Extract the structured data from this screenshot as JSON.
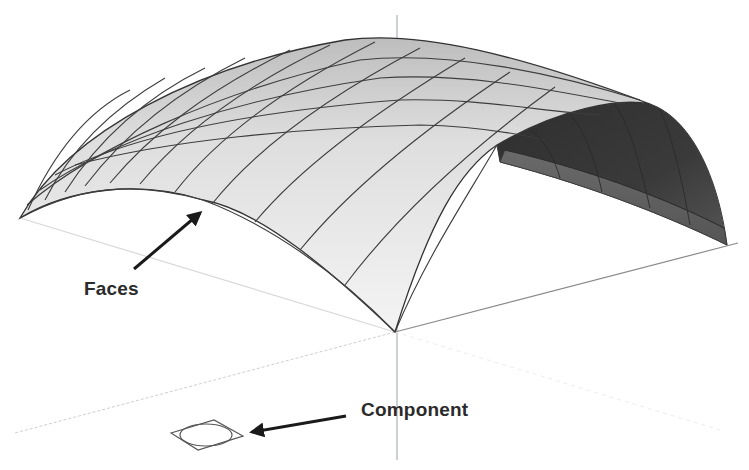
{
  "diagram": {
    "colors": {
      "background": "#ffffff",
      "face_light": "#f2f2f2",
      "face_mid": "#dcdcdc",
      "face_dark": "#5a5a5a",
      "face_darkest": "#333333",
      "edge": "#3a3a3a",
      "axis_blue": "#9aa0a8",
      "axis_red": "#8a8a8a",
      "axis_green": "#cfcfcf",
      "label_text": "#2b2b2b",
      "arrow": "#1a1a1a"
    },
    "annotations": [
      {
        "id": "faces",
        "text": "Faces",
        "points_to": "surface face of the vault"
      },
      {
        "id": "component",
        "text": "Component",
        "points_to": "component axes/origin icon"
      }
    ],
    "axes": [
      "blue (vertical)",
      "red (right)",
      "green (left, dotted)"
    ]
  }
}
